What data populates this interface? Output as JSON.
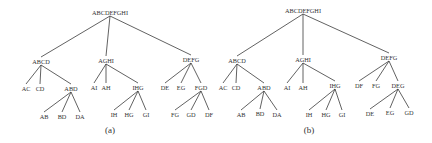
{
  "figure": {
    "panels": [
      {
        "caption": "(a)",
        "caption_pos": [
          110,
          133
        ],
        "nodes": [
          {
            "id": "r",
            "label": "ABCDEFGHI",
            "x": 110,
            "y": 13
          },
          {
            "id": "n1",
            "label": "ABCD",
            "x": 41,
            "y": 62,
            "parent": "r"
          },
          {
            "id": "n2",
            "label": "AGHI",
            "x": 106,
            "y": 61,
            "parent": "r"
          },
          {
            "id": "n3",
            "label": "DEFG",
            "x": 191,
            "y": 60,
            "parent": "r"
          },
          {
            "id": "n11",
            "label": "AC",
            "x": 26,
            "y": 89,
            "parent": "n1"
          },
          {
            "id": "n12",
            "label": "CD",
            "x": 40,
            "y": 89,
            "parent": "n1"
          },
          {
            "id": "n13",
            "label": "ABD",
            "x": 71,
            "y": 89,
            "parent": "n1"
          },
          {
            "id": "n21",
            "label": "AI",
            "x": 94,
            "y": 88,
            "parent": "n2"
          },
          {
            "id": "n22",
            "label": "AH",
            "x": 106,
            "y": 88,
            "parent": "n2"
          },
          {
            "id": "n23",
            "label": "IHG",
            "x": 138,
            "y": 88,
            "parent": "n2"
          },
          {
            "id": "n31",
            "label": "DE",
            "x": 165,
            "y": 88,
            "parent": "n3"
          },
          {
            "id": "n32",
            "label": "EG",
            "x": 181,
            "y": 88,
            "parent": "n3"
          },
          {
            "id": "n33",
            "label": "FGD",
            "x": 201,
            "y": 88,
            "parent": "n3"
          },
          {
            "id": "n131",
            "label": "AB",
            "x": 44,
            "y": 117,
            "parent": "n13"
          },
          {
            "id": "n132",
            "label": "BD",
            "x": 62,
            "y": 117,
            "parent": "n13"
          },
          {
            "id": "n133",
            "label": "DA",
            "x": 80,
            "y": 117,
            "parent": "n13"
          },
          {
            "id": "n231",
            "label": "IH",
            "x": 114,
            "y": 115,
            "parent": "n23"
          },
          {
            "id": "n232",
            "label": "HG",
            "x": 129,
            "y": 115,
            "parent": "n23"
          },
          {
            "id": "n233",
            "label": "GI",
            "x": 146,
            "y": 115,
            "parent": "n23"
          },
          {
            "id": "n331",
            "label": "FG",
            "x": 175,
            "y": 115,
            "parent": "n33"
          },
          {
            "id": "n332",
            "label": "GD",
            "x": 191,
            "y": 115,
            "parent": "n33"
          },
          {
            "id": "n333",
            "label": "DF",
            "x": 209,
            "y": 115,
            "parent": "n33"
          }
        ]
      },
      {
        "caption": "(b)",
        "caption_pos": [
          309,
          133
        ],
        "nodes": [
          {
            "id": "r",
            "label": "ABCDEFGHI",
            "x": 303,
            "y": 11
          },
          {
            "id": "n1",
            "label": "ABCD",
            "x": 237,
            "y": 61,
            "parent": "r"
          },
          {
            "id": "n2",
            "label": "AGHI",
            "x": 303,
            "y": 60,
            "parent": "r"
          },
          {
            "id": "n3",
            "label": "DEFG",
            "x": 389,
            "y": 58,
            "parent": "r"
          },
          {
            "id": "n11",
            "label": "AC",
            "x": 223,
            "y": 88,
            "parent": "n1"
          },
          {
            "id": "n12",
            "label": "CD",
            "x": 236,
            "y": 88,
            "parent": "n1"
          },
          {
            "id": "n13",
            "label": "ABD",
            "x": 264,
            "y": 88,
            "parent": "n1"
          },
          {
            "id": "n21",
            "label": "AI",
            "x": 287,
            "y": 88,
            "parent": "n2"
          },
          {
            "id": "n22",
            "label": "AH",
            "x": 303,
            "y": 88,
            "parent": "n2"
          },
          {
            "id": "n23",
            "label": "IHG",
            "x": 335,
            "y": 86,
            "parent": "n2"
          },
          {
            "id": "n31",
            "label": "DF",
            "x": 359,
            "y": 86,
            "parent": "n3"
          },
          {
            "id": "n32",
            "label": "FG",
            "x": 376,
            "y": 86,
            "parent": "n3"
          },
          {
            "id": "n33",
            "label": "DEG",
            "x": 398,
            "y": 86,
            "parent": "n3"
          },
          {
            "id": "n131",
            "label": "AB",
            "x": 241,
            "y": 115,
            "parent": "n13"
          },
          {
            "id": "n132",
            "label": "BD",
            "x": 260,
            "y": 114,
            "parent": "n13"
          },
          {
            "id": "n133",
            "label": "DA",
            "x": 277,
            "y": 115,
            "parent": "n13"
          },
          {
            "id": "n231",
            "label": "IH",
            "x": 309,
            "y": 115,
            "parent": "n23"
          },
          {
            "id": "n232",
            "label": "HG",
            "x": 326,
            "y": 115,
            "parent": "n23"
          },
          {
            "id": "n233",
            "label": "GI",
            "x": 342,
            "y": 115,
            "parent": "n23"
          },
          {
            "id": "n331",
            "label": "DE",
            "x": 370,
            "y": 114,
            "parent": "n33"
          },
          {
            "id": "n332",
            "label": "EG",
            "x": 390,
            "y": 113,
            "parent": "n33"
          },
          {
            "id": "n333",
            "label": "GD",
            "x": 409,
            "y": 113,
            "parent": "n33"
          }
        ]
      }
    ]
  }
}
